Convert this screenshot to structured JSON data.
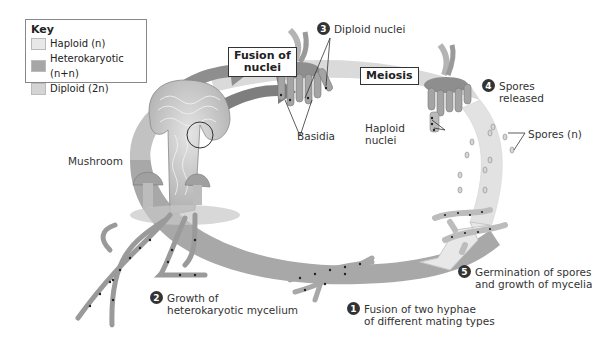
{
  "key": {
    "title": "Key",
    "items": [
      {
        "label": "Haploid (n)",
        "color": "#e8e8e8"
      },
      {
        "label": "Heterokaryotic (n+n)",
        "color": "#a6a6a6"
      },
      {
        "label": "Diploid (2n)",
        "color": "#d4d4d4"
      }
    ]
  },
  "colors": {
    "cycle_ring_light": "#dcdcdc",
    "cycle_ring_dark": "#a8a8a8",
    "arrow": "#9a9a9a",
    "hyphae_fill": "#d8d8d8",
    "nucleus": "#222222"
  },
  "boxed_labels": {
    "fusion_of_nuclei_line1": "Fusion of",
    "fusion_of_nuclei_line2": "nuclei",
    "meiosis": "Meiosis"
  },
  "labels": {
    "mushroom": "Mushroom",
    "basidia": "Basidia",
    "haploid_nuclei_line1": "Haploid",
    "haploid_nuclei_line2": "nuclei",
    "spores": "Spores (n)"
  },
  "steps": [
    {
      "number": "1",
      "line1": "Fusion of two hyphae",
      "line2": "of different mating types"
    },
    {
      "number": "2",
      "line1": "Growth of",
      "line2": "heterokaryotic mycelium"
    },
    {
      "number": "3",
      "line1": "Diploid nuclei",
      "line2": ""
    },
    {
      "number": "4",
      "line1": "Spores",
      "line2": "released"
    },
    {
      "number": "5",
      "line1": "Germination of spores",
      "line2": "and growth of mycelia"
    }
  ]
}
